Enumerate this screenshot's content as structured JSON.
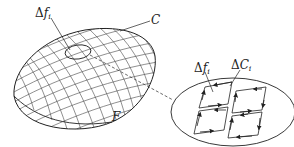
{
  "diagram": {
    "type": "surface-integral-stokes-illustration",
    "labels": {
      "surface_element": {
        "symbol": "Δ",
        "var": "f",
        "sub": "i"
      },
      "boundary_curve": "C",
      "surface": "F",
      "zoom_surface_element": {
        "symbol": "Δ",
        "var": "f",
        "sub": "i"
      },
      "zoom_boundary_element": {
        "symbol": "Δ",
        "var": "C",
        "sub": "i"
      }
    },
    "colors": {
      "stroke": "#333333",
      "background": "#ffffff"
    }
  }
}
